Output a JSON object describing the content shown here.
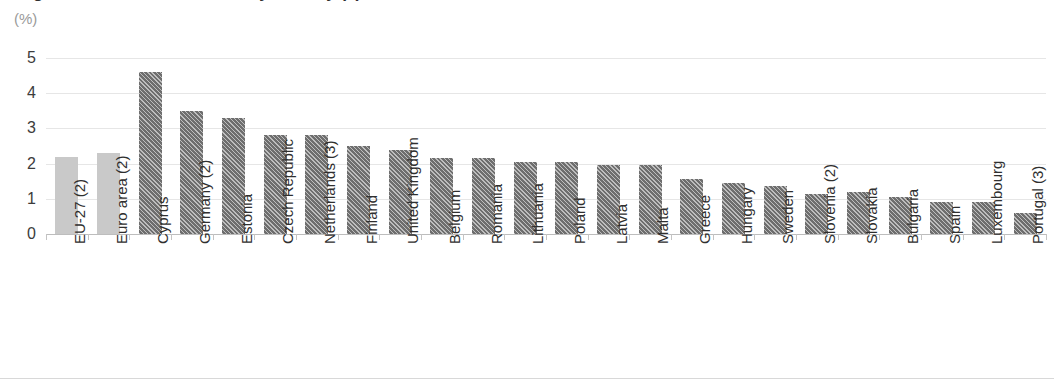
{
  "title": "Figure: Annual inflation rate by country (2)",
  "unit_label": "(%)",
  "chart_data": {
    "type": "bar",
    "title": "Figure: Annual inflation rate by country (2)",
    "subtitle": "(%)",
    "xlabel": "",
    "ylabel": "(%)",
    "ylim": [
      0,
      5
    ],
    "yticks": [
      0,
      1,
      2,
      3,
      4,
      5
    ],
    "ytick_labels": [
      "0",
      "1",
      "2",
      "3",
      "4",
      "5"
    ],
    "grid": true,
    "legend": "none",
    "categories": [
      "EU-27 (2)",
      "Euro area (2)",
      "Cyprus",
      "Germany (2)",
      "Estonia",
      "Czech Republic",
      "Netherlands (3)",
      "Finland",
      "United Kingdom",
      "Belgium",
      "Romania",
      "Lithuania",
      "Poland",
      "Latvia",
      "Malta",
      "Greece",
      "Hungary",
      "Sweden",
      "Slovenia (2)",
      "Slovakia",
      "Bulgaria",
      "Spain",
      "Luxembourg",
      "Portugal (3)"
    ],
    "values": [
      2.2,
      2.3,
      4.6,
      3.5,
      3.3,
      2.8,
      2.8,
      2.5,
      2.4,
      2.15,
      2.15,
      2.05,
      2.05,
      1.95,
      1.95,
      1.55,
      1.45,
      1.35,
      1.15,
      1.2,
      1.05,
      0.9,
      0.9,
      0.6
    ],
    "series_styles": [
      "aggregate",
      "aggregate",
      "country",
      "country",
      "country",
      "country",
      "country",
      "country",
      "country",
      "country",
      "country",
      "country",
      "country",
      "country",
      "country",
      "country",
      "country",
      "country",
      "country",
      "country",
      "country",
      "country",
      "country",
      "country"
    ],
    "colors": {
      "aggregate_bar": "#c9c9c9",
      "country_bar": "#6e6e6e",
      "gridline": "#e6e6e6",
      "axis": "#bdbdbd",
      "text": "#2f2f2f",
      "unit_text": "#9a9a9a"
    }
  }
}
